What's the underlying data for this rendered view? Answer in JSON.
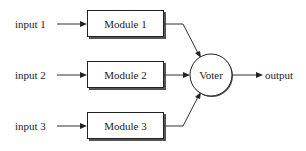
{
  "diagram": {
    "inputs": [
      {
        "label": "input  1"
      },
      {
        "label": "input  2"
      },
      {
        "label": "input  3"
      }
    ],
    "modules": [
      {
        "label": "Module 1"
      },
      {
        "label": "Module 2"
      },
      {
        "label": "Module 3"
      }
    ],
    "voter": {
      "label": "Voter"
    },
    "output": {
      "label": "output"
    }
  }
}
